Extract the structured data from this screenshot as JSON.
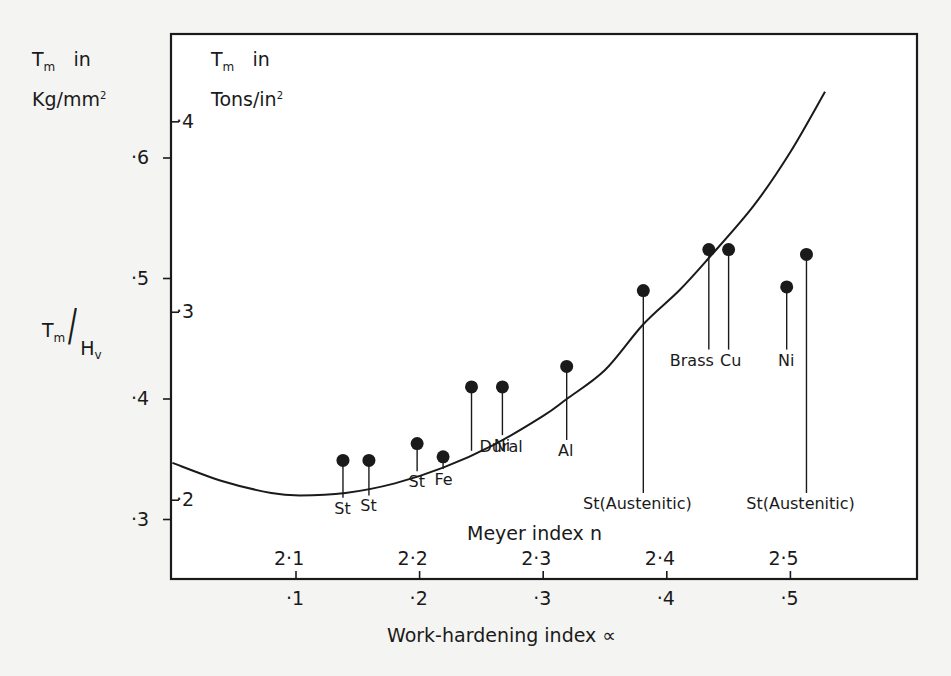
{
  "figure": {
    "left_axis_title": {
      "symbol": "T",
      "subscript": "m",
      "word": "in",
      "unit": "Kg/mm",
      "unit_sup": "2"
    },
    "inner_axis_title": {
      "symbol": "T",
      "subscript": "m",
      "word": "in",
      "unit": "Tons/in",
      "unit_sup": "2"
    },
    "ratio_label": {
      "numerator": "T",
      "numerator_sub": "m",
      "slash": "/",
      "denominator": "H",
      "denominator_sub": "v"
    },
    "x_top_label": "Meyer  index n",
    "x_bottom_label": "Work-hardening  index ∝"
  },
  "chart_data": {
    "type": "scatter",
    "title": "",
    "xlabel": "Work-hardening index ∝ (bottom); Meyer index n (inner)",
    "ylabel": "Tm/Hv (Tm in Kg/mm², outer scale; Tm in Tons/in², inner scale)",
    "xlim": [
      0.0,
      0.605
    ],
    "ylim": [
      0.25,
      0.655
    ],
    "grid": false,
    "legend": null,
    "x_ticks": [
      {
        "value": 0.1,
        "label": "·1",
        "meyer_label": "2·1"
      },
      {
        "value": 0.2,
        "label": "·2",
        "meyer_label": "2·2"
      },
      {
        "value": 0.3,
        "label": "·3",
        "meyer_label": "2·3"
      },
      {
        "value": 0.4,
        "label": "·4",
        "meyer_label": "2·4"
      },
      {
        "value": 0.5,
        "label": "·5",
        "meyer_label": "2·5"
      }
    ],
    "y_ticks_kg": [
      {
        "value": 0.6,
        "label": "·6"
      },
      {
        "value": 0.5,
        "label": "·5"
      },
      {
        "value": 0.4,
        "label": "·4"
      },
      {
        "value": 0.3,
        "label": "·3"
      }
    ],
    "y_ticks_tons": [
      {
        "value_tons": 0.4,
        "label": "·4",
        "pos_kg": 0.63
      },
      {
        "value_tons": 0.3,
        "label": "·3",
        "pos_kg": 0.472
      },
      {
        "value_tons": 0.2,
        "label": "·2",
        "pos_kg": 0.316
      }
    ],
    "points": [
      {
        "label": "St",
        "x": 0.138,
        "y": 0.349,
        "stem_to": 0.318,
        "label_pos": "below"
      },
      {
        "label": "St",
        "x": 0.159,
        "y": 0.349,
        "stem_to": 0.32,
        "label_pos": "below"
      },
      {
        "label": "St",
        "x": 0.198,
        "y": 0.363,
        "stem_to": 0.34,
        "label_pos": "below"
      },
      {
        "label": "Fe",
        "x": 0.219,
        "y": 0.352,
        "stem_to": 0.342,
        "label_pos": "below"
      },
      {
        "label": "Dural",
        "x": 0.242,
        "y": 0.41,
        "stem_to": 0.357,
        "label_pos": "below-right"
      },
      {
        "label": "Ni",
        "x": 0.267,
        "y": 0.41,
        "stem_to": 0.37,
        "label_pos": "below"
      },
      {
        "label": "Al",
        "x": 0.319,
        "y": 0.427,
        "stem_to": 0.366,
        "label_pos": "below"
      },
      {
        "label": "St(Austenitic)",
        "x": 0.381,
        "y": 0.49,
        "stem_to": 0.322,
        "label_pos": "below"
      },
      {
        "label": "Brass",
        "x": 0.434,
        "y": 0.524,
        "stem_to": 0.441,
        "label_pos": "below-left"
      },
      {
        "label": "Cu",
        "x": 0.45,
        "y": 0.524,
        "stem_to": 0.441,
        "label_pos": "below"
      },
      {
        "label": "Ni",
        "x": 0.497,
        "y": 0.493,
        "stem_to": 0.441,
        "label_pos": "below"
      },
      {
        "label": "St(Austenitic)",
        "x": 0.513,
        "y": 0.52,
        "stem_to": 0.322,
        "label_pos": "below"
      }
    ],
    "curve": {
      "name": "fitted curve",
      "x": [
        0.0,
        0.04,
        0.08,
        0.103,
        0.14,
        0.18,
        0.219,
        0.26,
        0.3,
        0.319,
        0.35,
        0.381,
        0.41,
        0.434,
        0.47,
        0.5,
        0.528
      ],
      "y": [
        0.347,
        0.332,
        0.322,
        0.32,
        0.322,
        0.33,
        0.343,
        0.362,
        0.386,
        0.4,
        0.424,
        0.462,
        0.49,
        0.517,
        0.56,
        0.605,
        0.655
      ]
    }
  },
  "colors": {
    "ink": "#1a1a1a",
    "paper": "#f4f4f2"
  }
}
